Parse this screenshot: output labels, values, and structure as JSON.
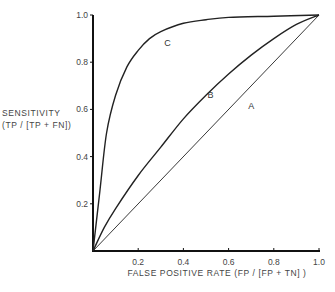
{
  "chart_data": {
    "type": "line",
    "title": "",
    "xlabel": "FALSE POSITIVE RATE (FP / [FP + TN] )",
    "ylabel_line1": "SENSITIVITY",
    "ylabel_line2": "(TP / [TP + FN])",
    "xlim": [
      0,
      1.0
    ],
    "ylim": [
      0,
      1.0
    ],
    "grid": false,
    "legend": "none",
    "x_ticks": [
      "0.2",
      "0.4",
      "0.6",
      "0.8",
      "1.0"
    ],
    "y_ticks": [
      "0.2",
      "0.4",
      "0.6",
      "0.8",
      "1.0"
    ],
    "series": [
      {
        "name": "A",
        "x": [
          0,
          1.0
        ],
        "y": [
          0,
          1.0
        ],
        "label_pos": [
          0.7,
          0.6
        ]
      },
      {
        "name": "B",
        "x": [
          0,
          0.05,
          0.1,
          0.2,
          0.3,
          0.4,
          0.5,
          0.6,
          0.7,
          0.8,
          0.9,
          1.0
        ],
        "y": [
          0,
          0.1,
          0.18,
          0.32,
          0.44,
          0.56,
          0.66,
          0.75,
          0.83,
          0.9,
          0.96,
          1.0
        ],
        "label_pos": [
          0.52,
          0.65
        ]
      },
      {
        "name": "C",
        "x": [
          0,
          0.03,
          0.06,
          0.1,
          0.15,
          0.2,
          0.25,
          0.3,
          0.4,
          0.5,
          0.6,
          0.8,
          1.0
        ],
        "y": [
          0,
          0.25,
          0.5,
          0.66,
          0.78,
          0.85,
          0.9,
          0.93,
          0.965,
          0.98,
          0.99,
          0.995,
          1.0
        ],
        "label_pos": [
          0.33,
          0.87
        ]
      }
    ]
  }
}
